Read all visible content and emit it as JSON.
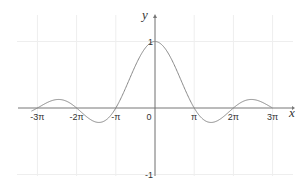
{
  "chart_data": {
    "type": "line",
    "title": "",
    "function": "sin(x)/x",
    "xlabel": "x",
    "ylabel": "y",
    "xlim": [
      -9.9,
      9.4
    ],
    "ylim": [
      -1,
      1.45
    ],
    "grid": true,
    "x_ticks": [
      {
        "value": -9.4248,
        "label": "-3π"
      },
      {
        "value": -6.2832,
        "label": "-2π"
      },
      {
        "value": -3.1416,
        "label": "-π"
      },
      {
        "value": 0,
        "label": "0"
      },
      {
        "value": 3.1416,
        "label": "π"
      },
      {
        "value": 6.2832,
        "label": "2π"
      },
      {
        "value": 9.4248,
        "label": "3π"
      }
    ],
    "y_ticks": [
      {
        "value": 1,
        "label": "1"
      },
      {
        "value": -1,
        "label": "-1"
      }
    ],
    "series": [
      {
        "name": "sinc",
        "color": "#888888",
        "x": [
          -9.9,
          -9.4248,
          -8.5,
          -7.7253,
          -7.0,
          -6.2832,
          -5.5,
          -4.4934,
          -3.8,
          -3.1416,
          -2.5,
          -2.0,
          -1.5,
          -1.0,
          -0.5,
          0,
          0.5,
          1.0,
          1.5,
          2.0,
          2.5,
          3.1416,
          3.8,
          4.4934,
          5.5,
          6.2832,
          7.0,
          7.7253,
          8.5,
          9.4248,
          9.9
        ],
        "y": [
          -0.0462,
          0,
          0.0939,
          0.1284,
          0.0939,
          0,
          -0.1282,
          -0.2172,
          -0.1614,
          0,
          0.2394,
          0.4546,
          0.665,
          0.8415,
          0.9589,
          1,
          0.9589,
          0.8415,
          0.665,
          0.4546,
          0.2394,
          0,
          -0.1614,
          -0.2172,
          -0.1282,
          0,
          0.0939,
          0.1284,
          0.0939,
          0,
          -0.0462
        ]
      }
    ]
  },
  "colors": {
    "axis": "#777777",
    "grid": "#eeeeee",
    "curve": "#8a8a8a"
  }
}
